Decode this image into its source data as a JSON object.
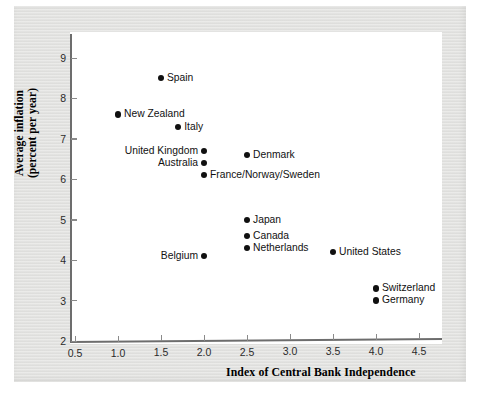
{
  "chart_data": {
    "type": "scatter",
    "title": "",
    "xlabel": "Index of Central Bank Independence",
    "ylabel": "Average inflation (percent per year)",
    "ylabel_line1": "Average inflation",
    "ylabel_line2": "(percent per year)",
    "xlim": [
      0.5,
      4.5
    ],
    "ylim": [
      2,
      9.5
    ],
    "xticks": [
      "0.5",
      "1.0",
      "1.5",
      "2.0",
      "2.5",
      "3.0",
      "3.5",
      "4.0",
      "4.5"
    ],
    "xtick_values": [
      0.5,
      1.0,
      1.5,
      2.0,
      2.5,
      3.0,
      3.5,
      4.0,
      4.5
    ],
    "yticks": [
      "9",
      "8",
      "7",
      "6",
      "5",
      "4",
      "3",
      "2"
    ],
    "ytick_values": [
      9,
      8,
      7,
      6,
      5,
      4,
      3,
      2
    ],
    "grid": false,
    "legend": "none",
    "marker_color": "#101010",
    "points": [
      {
        "label": "Spain",
        "x": 1.5,
        "y": 8.5,
        "label_side": "right"
      },
      {
        "label": "New Zealand",
        "x": 1.0,
        "y": 7.6,
        "label_side": "right"
      },
      {
        "label": "Italy",
        "x": 1.7,
        "y": 7.3,
        "label_side": "right"
      },
      {
        "label": "United Kingdom",
        "x": 2.0,
        "y": 6.7,
        "label_side": "left"
      },
      {
        "label": "Denmark",
        "x": 2.5,
        "y": 6.6,
        "label_side": "right"
      },
      {
        "label": "Australia",
        "x": 2.0,
        "y": 6.4,
        "label_side": "left"
      },
      {
        "label": "France/Norway/Sweden",
        "x": 2.0,
        "y": 6.1,
        "label_side": "right"
      },
      {
        "label": "Japan",
        "x": 2.5,
        "y": 5.0,
        "label_side": "right"
      },
      {
        "label": "Canada",
        "x": 2.5,
        "y": 4.6,
        "label_side": "right"
      },
      {
        "label": "Netherlands",
        "x": 2.5,
        "y": 4.3,
        "label_side": "right"
      },
      {
        "label": "Belgium",
        "x": 2.0,
        "y": 4.1,
        "label_side": "left"
      },
      {
        "label": "United States",
        "x": 3.5,
        "y": 4.2,
        "label_side": "right"
      },
      {
        "label": "Switzerland",
        "x": 4.0,
        "y": 3.3,
        "label_side": "right"
      },
      {
        "label": "Germany",
        "x": 4.0,
        "y": 3.0,
        "label_side": "right"
      }
    ]
  }
}
